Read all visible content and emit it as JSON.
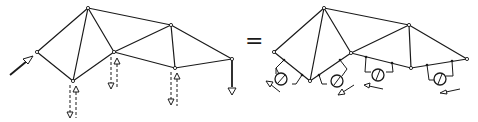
{
  "diagram": {
    "title": "",
    "operator": "=",
    "left_truss": {
      "description": "Truss under external load with virtual unit-load pairs",
      "nodes": {
        "A": [
          37,
          52
        ],
        "B": [
          88,
          8
        ],
        "C": [
          73,
          81
        ],
        "D": [
          114,
          52
        ],
        "E": [
          171,
          25
        ],
        "F": [
          175,
          68
        ],
        "G": [
          232,
          59
        ]
      },
      "members": [
        [
          "A",
          "B"
        ],
        [
          "A",
          "C"
        ],
        [
          "B",
          "C"
        ],
        [
          "B",
          "D"
        ],
        [
          "B",
          "E"
        ],
        [
          "C",
          "D"
        ],
        [
          "D",
          "E"
        ],
        [
          "D",
          "F"
        ],
        [
          "E",
          "F"
        ],
        [
          "E",
          "G"
        ],
        [
          "F",
          "G"
        ]
      ],
      "loads": [
        {
          "type": "applied-force",
          "at": "A",
          "direction": "up-right"
        },
        {
          "type": "vertical-load",
          "at": "G",
          "direction": "down"
        }
      ],
      "virtual_pairs": [
        {
          "at": "C"
        },
        {
          "at": "D"
        },
        {
          "at": "F"
        }
      ]
    },
    "right_truss": {
      "description": "Equivalent truss with strain gauges / meters on bottom chord members",
      "nodes": {
        "A": [
          274,
          52
        ],
        "B": [
          324,
          8
        ],
        "C": [
          310,
          81
        ],
        "D": [
          351,
          53
        ],
        "E": [
          409,
          25
        ],
        "F": [
          411,
          68
        ],
        "G": [
          467,
          59
        ]
      },
      "members": [
        [
          "A",
          "B"
        ],
        [
          "A",
          "C"
        ],
        [
          "B",
          "C"
        ],
        [
          "B",
          "D"
        ],
        [
          "B",
          "E"
        ],
        [
          "C",
          "D"
        ],
        [
          "D",
          "E"
        ],
        [
          "D",
          "F"
        ],
        [
          "E",
          "F"
        ],
        [
          "E",
          "G"
        ],
        [
          "F",
          "G"
        ]
      ],
      "meters": [
        {
          "member": "A-C",
          "label": "meter-1"
        },
        {
          "member": "C-D",
          "label": "meter-2"
        },
        {
          "member": "D-F",
          "label": "meter-3"
        },
        {
          "member": "F-G",
          "label": "meter-4"
        }
      ],
      "direction_arrows": 4
    }
  }
}
